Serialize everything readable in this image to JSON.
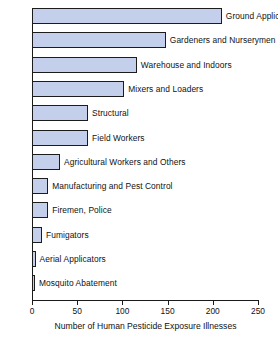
{
  "chart_data": {
    "type": "bar",
    "orientation": "horizontal",
    "title": "",
    "xlabel": "Number of Human Pesticide Exposure Illnesses",
    "ylabel": "",
    "xlim": [
      0,
      250
    ],
    "xticks": [
      0,
      50,
      100,
      150,
      200,
      250
    ],
    "grid": false,
    "legend": null,
    "bar_color": "#c3cfeb",
    "bar_edge_color": "#1c1c1c",
    "axis_color": "#1a1a1a",
    "categories": [
      "Ground Applicators",
      "Gardeners and Nurserymen",
      "Warehouse and Indoors",
      "Mixers and Loaders",
      "Structural",
      "Field Workers",
      "Agricultural Workers and Others",
      "Manufacturing and Pest Control",
      "Firemen, Police",
      "Fumigators",
      "Aerial Applicators",
      "Mosquito Abatement"
    ],
    "values": [
      210,
      148,
      116,
      102,
      62,
      62,
      31,
      18,
      18,
      11,
      4,
      3
    ]
  }
}
